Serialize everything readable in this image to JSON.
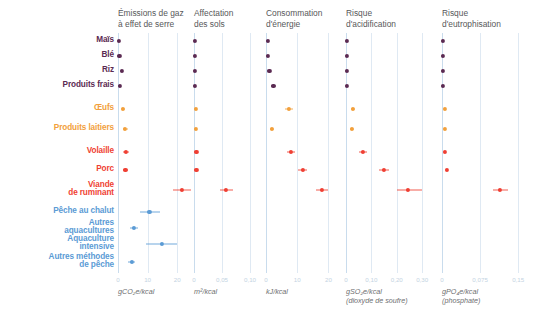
{
  "chart_data": {
    "type": "scatter",
    "title": "",
    "subtitle": "",
    "layout": "small-multiples dot plot with error bars, 5 panels sharing common category rows",
    "grid": true,
    "legend": null,
    "category_axis_label": "",
    "categories": [
      "Maïs",
      "Blé",
      "Riz",
      "Produits frais",
      "Œufs",
      "Produits laitiers",
      "Volaille",
      "Porc",
      "Viande\nde ruminant",
      "Pêche au chalut",
      "Autres\naquacultures",
      "Aquaculture\nintensive",
      "Autres méthodes\nde pêche"
    ],
    "category_groups": [
      {
        "name": "vegetal",
        "color": "#5b2a52",
        "rows": [
          0,
          1,
          2,
          3
        ]
      },
      {
        "name": "oeufs-laitiers",
        "color": "#f2a03c",
        "rows": [
          4,
          5
        ]
      },
      {
        "name": "viande",
        "color": "#ef3f33",
        "rows": [
          6,
          7,
          8
        ]
      },
      {
        "name": "peche",
        "color": "#5b9bd5",
        "rows": [
          9,
          10,
          11,
          12
        ]
      }
    ],
    "panels": [
      {
        "id": "ges",
        "title": "Émissions de gaz\nà effet de serre",
        "unit": "gCO₂e/kcal",
        "unit_note": "",
        "xlim": [
          0,
          25
        ],
        "ticks": [
          0,
          10,
          20
        ],
        "tick_labels": [
          "0",
          "10",
          "20"
        ],
        "values": [
          0.4,
          0.5,
          1.3,
          0.6,
          1.7,
          2.4,
          2.6,
          2.5,
          21.6,
          10.6,
          5.4,
          14.8,
          4.6
        ],
        "low": [
          0.2,
          0.3,
          0.9,
          0.3,
          1.2,
          1.6,
          1.8,
          1.7,
          18.5,
          7.3,
          4.0,
          9.6,
          3.4
        ],
        "high": [
          0.7,
          0.8,
          1.9,
          1.0,
          2.4,
          3.4,
          3.6,
          3.4,
          24.6,
          14.3,
          6.9,
          20.0,
          5.8
        ]
      },
      {
        "id": "sols",
        "title": "Affectation\ndes sols",
        "unit": "m²/kcal",
        "unit_note": "",
        "xlim": [
          0,
          0.125
        ],
        "ticks": [
          0,
          0.05,
          0.1
        ],
        "tick_labels": [
          "0",
          "0,05",
          "0,10"
        ],
        "values": [
          0.0018,
          0.002,
          0.0015,
          0.0016,
          0.003,
          0.0032,
          0.0042,
          0.0044,
          0.0575,
          null,
          null,
          null,
          null
        ],
        "low": [
          0.001,
          0.0012,
          0.0009,
          0.0009,
          0.002,
          0.0022,
          0.003,
          0.0031,
          0.047,
          null,
          null,
          null,
          null
        ],
        "high": [
          0.003,
          0.0032,
          0.0025,
          0.0026,
          0.0044,
          0.0046,
          0.0058,
          0.006,
          0.069,
          null,
          null,
          null,
          null
        ]
      },
      {
        "id": "energie",
        "title": "Consommation\nd'énergie",
        "unit": "kJ/kcal",
        "unit_note": "",
        "xlim": [
          0,
          25
        ],
        "ticks": [
          0,
          10,
          20
        ],
        "tick_labels": [
          "0",
          "10",
          "20"
        ],
        "values": [
          0.5,
          0.6,
          1.1,
          2.4,
          7.4,
          1.9,
          7.9,
          11.8,
          18.0,
          null,
          null,
          null,
          null
        ],
        "low": [
          0.3,
          0.4,
          0.8,
          1.7,
          6.2,
          1.3,
          6.6,
          10.4,
          16.0,
          null,
          null,
          null,
          null
        ],
        "high": [
          0.8,
          1.0,
          1.6,
          3.3,
          8.7,
          2.7,
          9.3,
          13.2,
          20.0,
          null,
          null,
          null,
          null
        ]
      },
      {
        "id": "acidification",
        "title": "Risque\nd'acidification",
        "unit": "gSO₂e/kcal",
        "unit_note": "(dioxyde de soufre)",
        "xlim": [
          0,
          0.37
        ],
        "ticks": [
          0,
          0.1,
          0.2,
          0.3
        ],
        "tick_labels": [
          "0",
          "0,10",
          "0,20",
          "0,30"
        ],
        "values": [
          0.004,
          0.005,
          0.004,
          0.005,
          0.028,
          0.023,
          0.066,
          0.148,
          0.244,
          null,
          null,
          null,
          null
        ],
        "low": [
          0.002,
          0.003,
          0.002,
          0.003,
          0.02,
          0.016,
          0.052,
          0.13,
          0.2,
          null,
          null,
          null,
          null
        ],
        "high": [
          0.007,
          0.008,
          0.007,
          0.008,
          0.037,
          0.032,
          0.082,
          0.168,
          0.3,
          null,
          null,
          null,
          null
        ]
      },
      {
        "id": "eutrophisation",
        "title": "Risque\nd'eutrophisation",
        "unit": "gPO₄e/kcal",
        "unit_note": "(phosphate)",
        "xlim": [
          0,
          0.185
        ],
        "ticks": [
          0,
          0.075,
          0.15
        ],
        "tick_labels": [
          "0",
          "0,075",
          "0,15"
        ],
        "values": [
          0.0022,
          0.0024,
          0.002,
          0.0024,
          0.006,
          0.0062,
          0.006,
          0.009,
          0.114,
          null,
          null,
          null,
          null
        ],
        "low": [
          0.0012,
          0.0014,
          0.0011,
          0.0013,
          0.0042,
          0.0044,
          0.0042,
          0.0065,
          0.101,
          null,
          null,
          null,
          null
        ],
        "high": [
          0.0035,
          0.0038,
          0.0032,
          0.0037,
          0.008,
          0.0082,
          0.008,
          0.012,
          0.129,
          null,
          null,
          null,
          null
        ]
      }
    ]
  }
}
